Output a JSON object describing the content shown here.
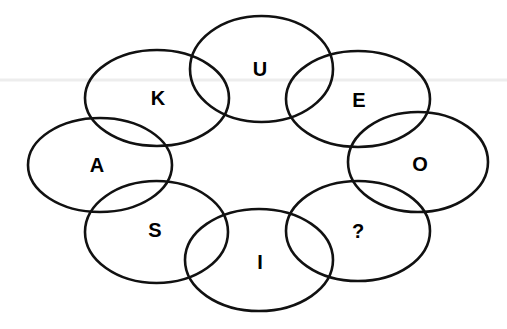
{
  "diagram": {
    "type": "overlapping-ellipse-ring-puzzle",
    "canvas": {
      "width": 507,
      "height": 329,
      "background_color": "#ffffff"
    },
    "style": {
      "stroke_color": "#111111",
      "stroke_width": 2.6,
      "fill": "none",
      "label_color": "#000000",
      "label_font_size": 20,
      "label_font_weight": "bold"
    },
    "artifact": {
      "name": "scan-line",
      "color": "#ededed",
      "y": 80,
      "x1": 0,
      "x2": 507,
      "thickness": 3
    },
    "ring_order": [
      "U",
      "E",
      "O",
      "?",
      "I",
      "S",
      "A",
      "K"
    ],
    "missing_value": "?",
    "cells": [
      {
        "id": "cell-u",
        "label": "U",
        "position": "top-center",
        "cx": 261.5,
        "cy": 69,
        "rx": 71.5,
        "ry": 53,
        "label_x": 260,
        "label_y": 71
      },
      {
        "id": "cell-k",
        "label": "K",
        "position": "upper-left",
        "cx": 157,
        "cy": 98,
        "rx": 72,
        "ry": 48,
        "label_x": 158,
        "label_y": 100
      },
      {
        "id": "cell-e",
        "label": "E",
        "position": "upper-right",
        "cx": 358,
        "cy": 99,
        "rx": 72,
        "ry": 48,
        "label_x": 359,
        "label_y": 102
      },
      {
        "id": "cell-a",
        "label": "A",
        "position": "left",
        "cx": 100,
        "cy": 165,
        "rx": 72,
        "ry": 47,
        "label_x": 97,
        "label_y": 167
      },
      {
        "id": "cell-o",
        "label": "O",
        "position": "right",
        "cx": 418,
        "cy": 162,
        "rx": 70,
        "ry": 50,
        "label_x": 420,
        "label_y": 166
      },
      {
        "id": "cell-s",
        "label": "S",
        "position": "lower-left",
        "cx": 156.5,
        "cy": 232,
        "rx": 71.5,
        "ry": 51,
        "label_x": 155,
        "label_y": 232
      },
      {
        "id": "cell-question",
        "label": "?",
        "position": "lower-right",
        "cx": 358,
        "cy": 231,
        "rx": 72,
        "ry": 50,
        "label_x": 358,
        "label_y": 233
      },
      {
        "id": "cell-i",
        "label": "I",
        "position": "bottom-center",
        "cx": 259,
        "cy": 260,
        "rx": 74,
        "ry": 51,
        "label_x": 260,
        "label_y": 264
      }
    ]
  }
}
